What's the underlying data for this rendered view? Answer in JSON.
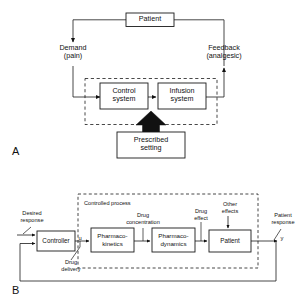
{
  "figure": {
    "panels": [
      {
        "letter": "A",
        "title": "Patient-controlled analgesia feedback loop",
        "boxes": [
          {
            "id": "patient",
            "label": "Patient"
          },
          {
            "id": "control-system",
            "label": "Control\nsystem"
          },
          {
            "id": "infusion-system",
            "label": "Infusion\nsystem"
          },
          {
            "id": "prescribed-setting",
            "label": "Prescribed\nsetting"
          }
        ],
        "signal_labels": [
          {
            "id": "demand",
            "label": "Demand\n(pain)"
          },
          {
            "id": "feedback",
            "label": "Feedback\n(analgesic)"
          }
        ]
      },
      {
        "letter": "B",
        "title": "Closed-loop drug delivery control system",
        "group_label": "Controlled process",
        "boxes": [
          {
            "id": "controller",
            "label": "Controller"
          },
          {
            "id": "pharmacokinetics",
            "label": "Pharmaco-\nkinetics"
          },
          {
            "id": "pharmacodynamics",
            "label": "Pharmaco-\ndynamics"
          },
          {
            "id": "patient",
            "label": "Patient"
          }
        ],
        "signal_labels": [
          {
            "id": "desired-response",
            "label": "Desired\nresponse"
          },
          {
            "id": "drug-delivery",
            "label": "Drug\ndelivery"
          },
          {
            "id": "drug-concentration",
            "label": "Drug\nconcentration"
          },
          {
            "id": "drug-effect",
            "label": "Drug\neffect"
          },
          {
            "id": "other-effects",
            "label": "Other\neffects"
          },
          {
            "id": "patient-response",
            "label": "Patient\nresponse"
          }
        ],
        "variables": [
          {
            "id": "u",
            "label": "u"
          },
          {
            "id": "y",
            "label": "y"
          }
        ]
      }
    ],
    "colors": {
      "stroke": "#1a1a1a",
      "fill": "#ffffff",
      "solid_arrow": "#111111",
      "background": "#ffffff"
    }
  }
}
